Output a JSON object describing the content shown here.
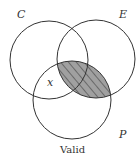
{
  "diagram": {
    "type": "venn",
    "sets": [
      {
        "name": "C",
        "cx": 49,
        "cy": 60,
        "r": 39
      },
      {
        "name": "E",
        "cx": 96,
        "cy": 59,
        "r": 39
      },
      {
        "name": "P",
        "cx": 72,
        "cy": 100,
        "r": 39
      }
    ],
    "labels": {
      "C": "C",
      "E": "E",
      "P": "P",
      "x_mark": "x",
      "caption": "Valid"
    },
    "shaded_region": "E ∩ P",
    "colors": {
      "stroke": "#333333",
      "shade": "#a0a0a0",
      "hatch": "#333333"
    }
  }
}
